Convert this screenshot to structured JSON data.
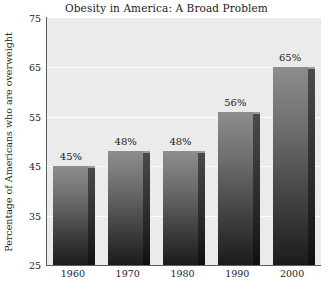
{
  "chart_data": {
    "type": "bar",
    "title": "Obesity in America: A Broad Problem",
    "xlabel": "",
    "ylabel": "Percentage of Americans who are overweight",
    "categories": [
      "1960",
      "1970",
      "1980",
      "1990",
      "2000"
    ],
    "values": [
      45,
      48,
      48,
      56,
      65
    ],
    "data_labels": [
      "45%",
      "48%",
      "48%",
      "56%",
      "65%"
    ],
    "ylim": [
      25,
      75
    ],
    "yticks": [
      25,
      35,
      45,
      55,
      65,
      75
    ],
    "ytick_labels": [
      "25",
      "35",
      "45",
      "55",
      "65",
      "75"
    ],
    "grid": true,
    "grid_axis": "y",
    "legend": false,
    "series": [
      {
        "name": "Percentage of Americans who are overweight",
        "values": [
          45,
          48,
          48,
          56,
          65
        ]
      }
    ],
    "colors": {
      "plot_background": "#ebebeb",
      "figure_background": "#ffffff",
      "gridline": "#fcfcfc",
      "axis_line": "#5d5d5d",
      "bar_top": "#8d8d8d",
      "bar_bottom": "#1b1b1b",
      "bar_side": "#3a3a3a",
      "text": "#1b1b1b"
    }
  }
}
